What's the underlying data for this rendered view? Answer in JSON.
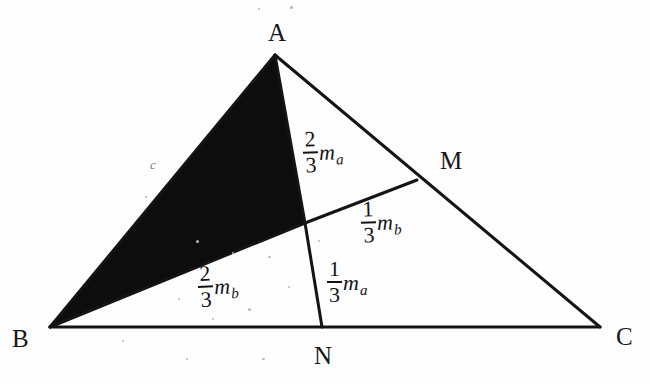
{
  "figure": {
    "background_color": "#fefefe",
    "ink_color": "#141417",
    "shaded_fill_color": "#0d0d0d",
    "faint_label_color": "#7d7d84"
  },
  "vertices": [
    {
      "name": "A",
      "label": "A",
      "point": {
        "x": 275,
        "y": 55
      },
      "label_pos": {
        "x": 268,
        "y": 20
      }
    },
    {
      "name": "B",
      "label": "B",
      "point": {
        "x": 50,
        "y": 327
      },
      "label_pos": {
        "x": 12,
        "y": 326
      }
    },
    {
      "name": "C",
      "label": "C",
      "point": {
        "x": 600,
        "y": 327
      },
      "label_pos": {
        "x": 616,
        "y": 324
      }
    },
    {
      "name": "M",
      "label": "M",
      "point": {
        "x": 417,
        "y": 180
      },
      "label_pos": {
        "x": 440,
        "y": 148
      }
    },
    {
      "name": "N",
      "label": "N",
      "point": {
        "x": 322,
        "y": 327
      },
      "label_pos": {
        "x": 314,
        "y": 343
      }
    }
  ],
  "centroid": {
    "name": "G",
    "point": {
      "x": 305,
      "y": 223
    }
  },
  "sides": [
    {
      "name": "AB",
      "label": "c",
      "label_pos": {
        "x": 150,
        "y": 158
      }
    },
    {
      "name": "BC",
      "label": "",
      "label_pos": null
    },
    {
      "name": "AC",
      "label": "",
      "label_pos": null
    }
  ],
  "segment_labels": [
    {
      "name": "ag-segment-label",
      "numerator": "2",
      "denominator": "3",
      "symbol": "m",
      "subscript": "a",
      "text": "2/3 m_a",
      "pos": {
        "x": 303,
        "y": 128
      }
    },
    {
      "name": "gm-segment-label",
      "numerator": "1",
      "denominator": "3",
      "symbol": "m",
      "subscript": "b",
      "text": "1/3 m_b",
      "pos": {
        "x": 361,
        "y": 198
      }
    },
    {
      "name": "gn-segment-label",
      "numerator": "1",
      "denominator": "3",
      "symbol": "m",
      "subscript": "a",
      "text": "1/3 m_a",
      "pos": {
        "x": 327,
        "y": 258
      }
    },
    {
      "name": "bg-segment-label",
      "numerator": "2",
      "denominator": "3",
      "symbol": "m",
      "subscript": "b",
      "text": "2/3 m_b",
      "pos": {
        "x": 198,
        "y": 262
      }
    }
  ],
  "edges": [
    {
      "name": "side-ab",
      "from": "A",
      "to": "B",
      "stroke_width": 3
    },
    {
      "name": "side-bc",
      "from": "B",
      "to": "C",
      "stroke_width": 3
    },
    {
      "name": "side-ac",
      "from": "A",
      "to": "C",
      "stroke_width": 3
    },
    {
      "name": "median-an",
      "from": "A",
      "to": "N",
      "stroke_width": 3
    },
    {
      "name": "median-bm",
      "from": "B",
      "to": "M",
      "stroke_width": 3
    }
  ],
  "shaded_region": {
    "name": "triangle-abg-shaded",
    "vertices": [
      "A",
      "B",
      "G"
    ],
    "fill": "#0d0d0d"
  }
}
